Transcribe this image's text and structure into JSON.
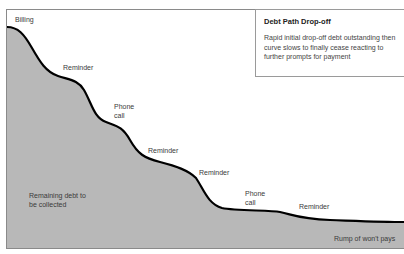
{
  "diagram": {
    "title": "Debt Path Drop-off",
    "description": "Rapid initial drop-off debt outstanding then curve slows to finally cease reacting to further prompts for payment",
    "stages": [
      {
        "label": "Billing"
      },
      {
        "label": "Reminder"
      },
      {
        "label": "Phone call"
      },
      {
        "label": "Reminder"
      },
      {
        "label": "Reminder"
      },
      {
        "label": "Phone call"
      },
      {
        "label": "Reminder"
      }
    ],
    "area_label": "Remaining debt to be collected",
    "tail_label": "Rump of won't pays",
    "colors": {
      "area_fill": "#b8b8b8",
      "curve": "#000000",
      "frame": "#8a8a8a"
    }
  },
  "labels": {
    "billing": "Billing",
    "reminder1": "Reminder",
    "phone1": "Phone call",
    "reminder2": "Reminder",
    "reminder3": "Reminder",
    "phone2": "Phone call",
    "reminder4": "Reminder",
    "area": "Remaining debt to be collected",
    "rump": "Rump of won't pays"
  }
}
